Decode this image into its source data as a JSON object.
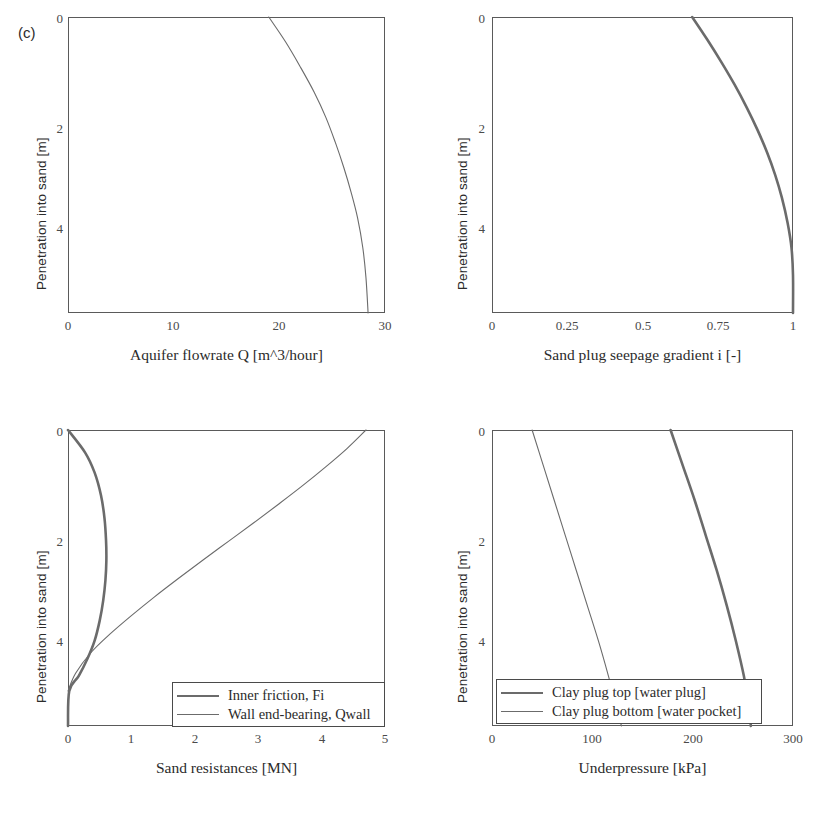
{
  "figure": {
    "panel_tag": "(c)",
    "background": "#ffffff",
    "line_color": "#6b6b6b",
    "frame_color": "#5a5a5a"
  },
  "chart_data": [
    {
      "id": "aquifer-flowrate",
      "type": "line",
      "title": "",
      "xlabel": "Aquifer flowrate Q [m^3/hour]",
      "ylabel": "Penetration into sand [m]",
      "xlim": [
        0,
        30
      ],
      "ylim": [
        0,
        5.9
      ],
      "y_inverted": true,
      "xticks": [
        "0",
        "10",
        "20",
        "30"
      ],
      "xtick_values": [
        0,
        10,
        20,
        30
      ],
      "yticks": [
        "0",
        "2",
        "4"
      ],
      "ytick_values": [
        0,
        2,
        4
      ],
      "grid": false,
      "legend": null,
      "series": [
        {
          "name": "Aquifer flowrate Q",
          "width": "thin",
          "x": [
            19.0,
            20.6,
            22.0,
            23.3,
            24.4,
            25.3,
            26.1,
            26.8,
            27.4,
            27.9,
            28.2,
            28.4
          ],
          "y": [
            0.0,
            0.5,
            1.0,
            1.5,
            2.0,
            2.5,
            3.0,
            3.5,
            4.0,
            4.6,
            5.2,
            5.9
          ]
        }
      ]
    },
    {
      "id": "sand-plug-seepage-gradient",
      "type": "line",
      "title": "",
      "xlabel": "Sand plug seepage gradient i [-]",
      "ylabel": "Penetration into sand [m]",
      "xlim": [
        0,
        1
      ],
      "ylim": [
        0,
        5.9
      ],
      "y_inverted": true,
      "xticks": [
        "0",
        "0.25",
        "0.5",
        "0.75",
        "1"
      ],
      "xtick_values": [
        0,
        0.25,
        0.5,
        0.75,
        1
      ],
      "yticks": [
        "0",
        "2",
        "4"
      ],
      "ytick_values": [
        0,
        2,
        4
      ],
      "grid": false,
      "legend": null,
      "series": [
        {
          "name": "Sand plug seepage gradient i",
          "width": "thick",
          "x": [
            0.665,
            0.715,
            0.762,
            0.806,
            0.846,
            0.882,
            0.914,
            0.941,
            0.963,
            0.982,
            0.995,
            1.0,
            1.0
          ],
          "y": [
            0.0,
            0.45,
            0.9,
            1.35,
            1.8,
            2.25,
            2.7,
            3.15,
            3.6,
            4.1,
            4.6,
            5.15,
            5.9
          ]
        }
      ]
    },
    {
      "id": "sand-resistances",
      "type": "line",
      "title": "",
      "xlabel": "Sand resistances [MN]",
      "ylabel": "Penetration into sand [m]",
      "xlim": [
        0,
        5
      ],
      "ylim": [
        0,
        5.9
      ],
      "y_inverted": true,
      "xticks": [
        "0",
        "1",
        "2",
        "3",
        "4",
        "5"
      ],
      "xtick_values": [
        0,
        1,
        2,
        3,
        4,
        5
      ],
      "yticks": [
        "0",
        "2",
        "4"
      ],
      "ytick_values": [
        0,
        2,
        4
      ],
      "grid": false,
      "legend": {
        "position": "bottom-right",
        "entries": [
          {
            "label": "Inner friction, Fi",
            "width": "thick"
          },
          {
            "label": "Wall end-bearing, Qwall",
            "width": "thin"
          }
        ]
      },
      "series": [
        {
          "name": "Inner friction, Fi",
          "width": "thick",
          "x": [
            0.0,
            0.27,
            0.42,
            0.52,
            0.575,
            0.6,
            0.605,
            0.59,
            0.555,
            0.5,
            0.42,
            0.31,
            0.17,
            0.02,
            0.0
          ],
          "y": [
            0.0,
            0.45,
            0.85,
            1.3,
            1.75,
            2.2,
            2.6,
            3.0,
            3.4,
            3.8,
            4.2,
            4.55,
            4.9,
            5.2,
            5.9
          ]
        },
        {
          "name": "Wall end-bearing, Qwall",
          "width": "thin",
          "x": [
            4.7,
            4.4,
            4.06,
            3.7,
            3.32,
            2.93,
            2.53,
            2.13,
            1.74,
            1.36,
            1.0,
            0.66,
            0.36,
            0.12,
            0.0
          ],
          "y": [
            0.0,
            0.37,
            0.74,
            1.11,
            1.48,
            1.85,
            2.22,
            2.59,
            2.96,
            3.33,
            3.7,
            4.07,
            4.44,
            4.85,
            5.2
          ]
        }
      ]
    },
    {
      "id": "underpressure",
      "type": "line",
      "title": "",
      "xlabel": "Underpressure [kPa]",
      "ylabel": "Penetration into sand [m]",
      "xlim": [
        0,
        300
      ],
      "ylim": [
        0,
        5.9
      ],
      "y_inverted": true,
      "xticks": [
        "0",
        "100",
        "200",
        "300"
      ],
      "xtick_values": [
        0,
        100,
        200,
        300
      ],
      "yticks": [
        "0",
        "2",
        "4"
      ],
      "ytick_values": [
        0,
        2,
        4
      ],
      "grid": false,
      "legend": {
        "position": "bottom-left",
        "entries": [
          {
            "label": "Clay plug top [water plug]",
            "width": "thick"
          },
          {
            "label": "Clay plug bottom [water pocket]",
            "width": "thin"
          }
        ]
      },
      "series": [
        {
          "name": "Clay plug top [water plug]",
          "width": "thick",
          "x": [
            178,
            190,
            202,
            213,
            224,
            234,
            243,
            251,
            256,
            258
          ],
          "y": [
            0.0,
            0.7,
            1.4,
            2.1,
            2.8,
            3.5,
            4.2,
            4.9,
            5.5,
            5.9
          ]
        },
        {
          "name": "Clay plug bottom [water pocket]",
          "width": "thin",
          "x": [
            40,
            51,
            62,
            73,
            84,
            95,
            106,
            116,
            124,
            129
          ],
          "y": [
            0.0,
            0.7,
            1.4,
            2.1,
            2.8,
            3.5,
            4.2,
            4.9,
            5.5,
            5.9
          ]
        }
      ]
    }
  ]
}
